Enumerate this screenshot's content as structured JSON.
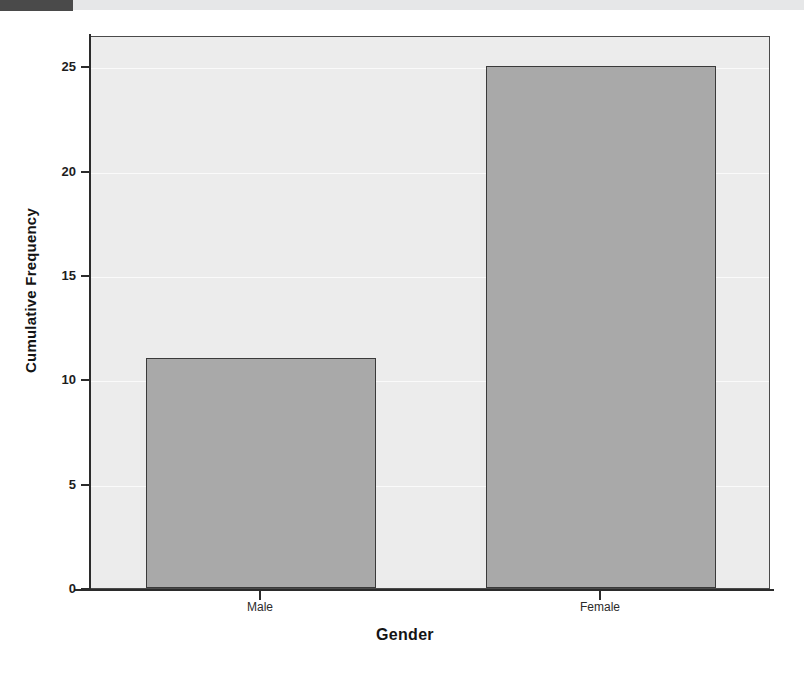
{
  "artifacts": {
    "top_band_color": "#e6e7e8",
    "top_block_color": "#4a4a4a"
  },
  "chart_data": {
    "type": "bar",
    "title": "",
    "subtitle": "",
    "categories": [
      "Male",
      "Female"
    ],
    "values": [
      11,
      25
    ],
    "xlabel": "Gender",
    "ylabel": "Cumulative Frequency",
    "ylim": [
      0,
      26.5
    ],
    "yticks": [
      0,
      5,
      10,
      15,
      20,
      25
    ],
    "ytick_labels": [
      "0",
      "5",
      "10",
      "15",
      "20",
      "25"
    ],
    "grid": true,
    "legend": false,
    "bar_color": "#a9a9a9",
    "bar_edge_color": "#3a3a3a",
    "plot_background": "#ececec",
    "axis_color": "#2b2b2b"
  }
}
